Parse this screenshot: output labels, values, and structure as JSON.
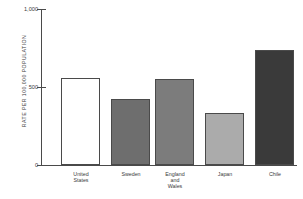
{
  "chart_data": {
    "type": "bar",
    "title": "",
    "subtitle": "",
    "xlabel": "",
    "ylabel": "RATE PER 100,000 POPULATION",
    "categories": [
      "United States",
      "Sweden",
      "England and Wales",
      "Japan",
      "Chile"
    ],
    "category_lines": [
      [
        "United",
        "States"
      ],
      [
        "Sweden"
      ],
      [
        "England",
        "and",
        "Wales"
      ],
      [
        "Japan"
      ],
      [
        "Chile"
      ]
    ],
    "values": [
      560,
      425,
      550,
      335,
      735
    ],
    "ylim": [
      0,
      1000
    ],
    "yticks": [
      0,
      500,
      1000
    ],
    "ytick_labels": [
      "0",
      "500",
      "1,000"
    ],
    "grid": false,
    "legend": "none",
    "bar_colors": [
      "#ffffff",
      "#6e6e6e",
      "#7c7c7c",
      "#ababab",
      "#3a3a3a"
    ],
    "bar_border_colors": [
      "#4a4a4a",
      "#4a4a4a",
      "#4a4a4a",
      "#4a4a4a",
      "#4a4a4a"
    ],
    "axis_color": "#4a4a4a"
  }
}
